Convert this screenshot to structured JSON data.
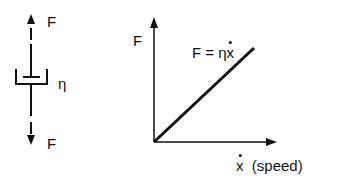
{
  "dashpot": {
    "top_force_label": "F",
    "bottom_force_label": "F",
    "viscosity_label": "η"
  },
  "graph": {
    "y_axis_label": "F",
    "equation": {
      "lhs": "F = η",
      "var": "x"
    },
    "x_axis_var": "x",
    "x_axis_unit": "(speed)"
  },
  "colors": {
    "ink": "#111111",
    "background": "#ffffff"
  }
}
